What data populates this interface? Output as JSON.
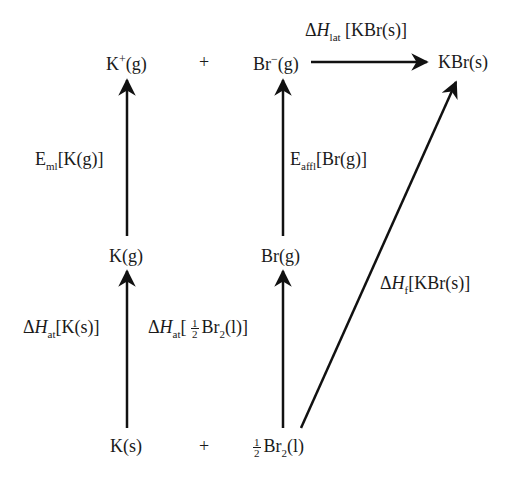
{
  "diagram": {
    "type": "born-haber-cycle",
    "compound": "KBr",
    "species": {
      "k_ion_gas": {
        "base": "K",
        "sup": "+",
        "state": "(g)"
      },
      "plus_top": "+",
      "br_ion_gas": {
        "base": "Br",
        "sup": "−",
        "state": "(g)"
      },
      "kbr_solid": "KBr(s)",
      "k_gas": "K(g)",
      "br_gas": "Br(g)",
      "k_solid": "K(s)",
      "plus_bottom": "+",
      "br2_liquid": {
        "frac_num": "1",
        "frac_den": "2",
        "base": "Br",
        "sub": "2",
        "state": "(l)"
      }
    },
    "steps": {
      "lattice": {
        "delta": "Δ",
        "symbol": "H",
        "sub": "lat",
        "target": " [KBr(s)]"
      },
      "ionisation": {
        "symbol": "E",
        "sub": "ml",
        "target": "[K(g)]"
      },
      "electron_affinity": {
        "symbol": "E",
        "sub": "affl",
        "target": "[Br(g)]"
      },
      "formation": {
        "delta": "Δ",
        "symbol": "H",
        "sub": "f",
        "target": "[KBr(s)]"
      },
      "atomisation_k": {
        "delta": "Δ",
        "symbol": "H",
        "sub": "at",
        "target": "[K(s)]"
      },
      "atomisation_br": {
        "delta": "Δ",
        "symbol": "H",
        "sub": "at",
        "open": "[ ",
        "frac_num": "1",
        "frac_den": "2",
        "base": "Br",
        "sub2": "2",
        "close": "(l)]"
      }
    }
  }
}
